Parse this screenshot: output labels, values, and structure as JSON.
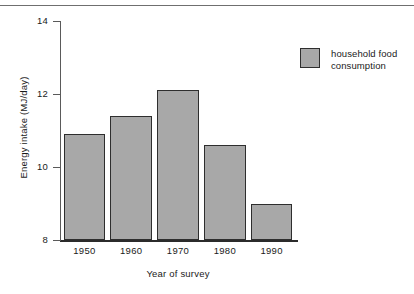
{
  "chart_data": {
    "type": "bar",
    "title": "",
    "xlabel": "Year of survey",
    "ylabel": "Energy intake (MJ/day)",
    "categories": [
      "1950",
      "1960",
      "1970",
      "1980",
      "1990"
    ],
    "values": [
      10.9,
      11.4,
      12.1,
      10.6,
      9.0
    ],
    "series": [
      {
        "name": "household food consumption",
        "values": [
          10.9,
          11.4,
          12.1,
          10.6,
          9.0
        ]
      }
    ],
    "ylim": [
      8,
      14
    ],
    "yticks": [
      8,
      10,
      12,
      14
    ],
    "ytick_labels": [
      "8",
      "10",
      "12",
      "14"
    ],
    "grid": false,
    "legend_position": "top-right",
    "bar_color": "#a8a8a8",
    "bar_edge_color": "#2e2e2e"
  },
  "legend": {
    "entries": [
      {
        "label": "household food consumption",
        "color": "#a8a8a8"
      }
    ]
  },
  "axes": {
    "y_title": "Energy intake (MJ/day)",
    "x_title": "Year of survey",
    "y_labels": [
      "14",
      "12",
      "10",
      "8"
    ],
    "x_labels": [
      "1950",
      "1960",
      "1970",
      "1980",
      "1990"
    ]
  }
}
